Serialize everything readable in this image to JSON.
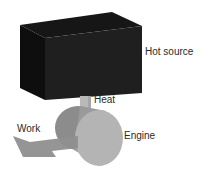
{
  "diagram": {
    "labels": {
      "hot_source": "Hot source",
      "heat": "Heat",
      "engine": "Engine",
      "work": "Work"
    },
    "colors": {
      "hot_source_front": "#1e1e1e",
      "hot_source_side": "#0e0e0e",
      "hot_source_top": "#161616",
      "heat_pipe": "#b9b9b9",
      "engine_back": "#8c8c8c",
      "engine_body": "#9c9c9c",
      "engine_front": "#b4b4b4",
      "work_arrow": "#8f8f8f",
      "text": "#2a2a2a"
    }
  }
}
